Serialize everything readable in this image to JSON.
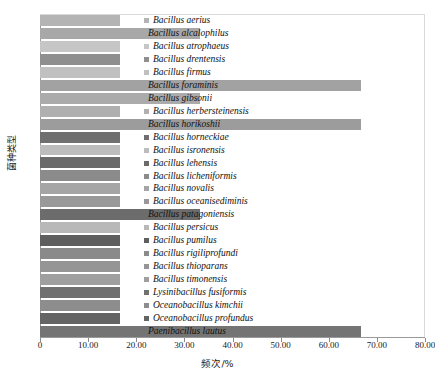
{
  "chart_data": {
    "type": "bar",
    "orientation": "horizontal",
    "title": "",
    "xlabel": "频次/%",
    "ylabel": "菌种类型",
    "xlim": [
      0,
      80
    ],
    "xticks": [
      "0",
      "10.00",
      "20.00",
      "30.00",
      "40.00",
      "50.00",
      "60.00",
      "70.00",
      "80.00"
    ],
    "xtick_values": [
      0,
      10,
      20,
      30,
      40,
      50,
      60,
      70,
      80
    ],
    "grid": false,
    "legend_position": "overlaid-right-of-bars",
    "categories": [
      "Bacillus aerius",
      "Bacillus alcalophilus",
      "Bacillus atrophaeus",
      "Bacillus drentensis",
      "Bacillus firmus",
      "Bacillus foraminis",
      "Bacillus gibsonii",
      "Bacillus herbersteinensis",
      "Bacillus horikoshii",
      "Bacillus horneckiae",
      "Bacillus isronensis",
      "Bacillus lehensis",
      "Bacillus licheniformis",
      "Bacillus novalis",
      "Bacillus oceanisediminis",
      "Bacillus patagoniensis",
      "Bacillus persicus",
      "Bacillus pumilus",
      "Bacillus rigiliprofundi",
      "Bacillus thioparans",
      "Bacillus timonensis",
      "Lysinibacillus fusiformis",
      "Oceanobacillus kimchii",
      "Oceanobacillus profundus",
      "Paenibacillus lautus"
    ],
    "values": [
      16.67,
      33.33,
      16.67,
      16.67,
      16.67,
      66.67,
      33.33,
      16.67,
      66.67,
      16.67,
      16.67,
      16.67,
      16.67,
      16.67,
      16.67,
      33.33,
      16.67,
      16.67,
      16.67,
      16.67,
      16.67,
      16.67,
      16.67,
      16.67,
      66.67
    ],
    "colors": [
      "#b4b4b4",
      "#a8a8a8",
      "#c6c6c6",
      "#8f8f8f",
      "#c0c0c0",
      "#a2a2a2",
      "#ababab",
      "#b0b0b0",
      "#9c9c9c",
      "#6f6f6f",
      "#bcbcbc",
      "#6a6a6a",
      "#8b8b8b",
      "#a5a5a5",
      "#999999",
      "#6c6c6c",
      "#b8b8b8",
      "#5e5e5e",
      "#8a8a8a",
      "#959595",
      "#9f9f9f",
      "#707070",
      "#8d8d8d",
      "#646464",
      "#747474"
    ],
    "swatch_visible": [
      true,
      false,
      true,
      true,
      true,
      false,
      false,
      true,
      false,
      true,
      true,
      true,
      true,
      true,
      true,
      false,
      true,
      true,
      true,
      true,
      true,
      true,
      true,
      true,
      false
    ]
  },
  "caption": ""
}
